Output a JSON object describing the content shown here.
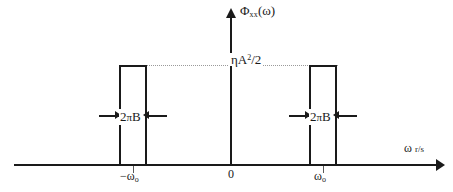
{
  "figure": {
    "type": "signal-spectrum-diagram"
  },
  "axes": {
    "y_label_main": "Φ",
    "y_label_sub": "xx",
    "y_label_arg": "(ω)",
    "x_label_symbol": "ω",
    "x_label_unit": "r/s",
    "origin_label": "0"
  },
  "ticks": {
    "negative_center": "−ω",
    "negative_center_sub": "o",
    "positive_center": "ω",
    "positive_center_sub": "o"
  },
  "level": {
    "label_prefix": "ηA",
    "label_exponent": "2",
    "label_suffix": "/2"
  },
  "bandwidth": {
    "left_label_prefix": "2",
    "left_label_pi": "π",
    "left_label_suffix": "B",
    "right_label_prefix": "2",
    "right_label_pi": "π",
    "right_label_suffix": "B"
  },
  "colors": {
    "stroke": "#1a1a1a",
    "dotted": "#9a9a9a",
    "background": "#ffffff"
  },
  "chart_data": {
    "type": "area",
    "title": "",
    "xlabel": "ω r/s",
    "ylabel": "Φxx(ω)",
    "x": [
      -1.62,
      -1.215,
      -1.215,
      -0.81,
      -0.81,
      0.81,
      0.81,
      1.215,
      1.215,
      1.62
    ],
    "values": [
      0,
      0,
      1,
      1,
      0,
      0,
      1,
      1,
      0,
      0
    ],
    "annotations": [
      {
        "text": "ηA²/2",
        "type": "level",
        "y": 1
      },
      {
        "text": "2πB",
        "type": "width",
        "center": -1.0
      },
      {
        "text": "2πB",
        "type": "width",
        "center": 1.0
      },
      {
        "text": "−ωo",
        "type": "xtick",
        "x": -1.0
      },
      {
        "text": "ωo",
        "type": "xtick",
        "x": 1.0
      },
      {
        "text": "0",
        "type": "xtick",
        "x": 0
      }
    ],
    "grid": false,
    "legend": "none"
  }
}
